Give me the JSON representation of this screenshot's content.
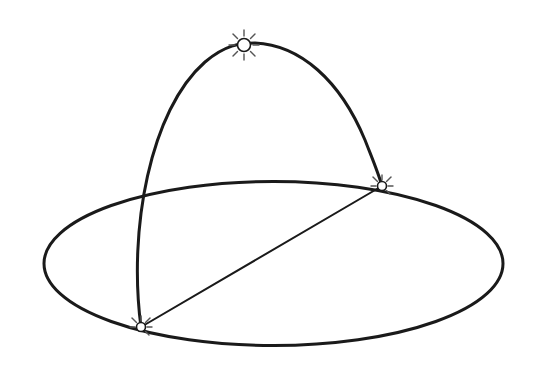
{
  "diagram": {
    "type": "celestial-sphere-sun-path",
    "background": "#ffffff",
    "stroke_color": "#1a1a1a",
    "horizon_ellipse": {
      "cx": 273.5,
      "cy": 263.5,
      "rx": 229.5,
      "ry": 82
    },
    "sun_path_arc": {
      "start": [
        141,
        327
      ],
      "peak": [
        244,
        45
      ],
      "end": [
        382,
        186
      ]
    },
    "chord": {
      "from": [
        141,
        327
      ],
      "to": [
        382,
        186
      ]
    },
    "sun_markers": [
      {
        "name": "noon-sun",
        "x": 244,
        "y": 45,
        "r": 7
      },
      {
        "name": "rising-sun",
        "x": 382,
        "y": 186,
        "r": 5
      },
      {
        "name": "setting-sun",
        "x": 141,
        "y": 327,
        "r": 5
      }
    ],
    "labels": []
  }
}
